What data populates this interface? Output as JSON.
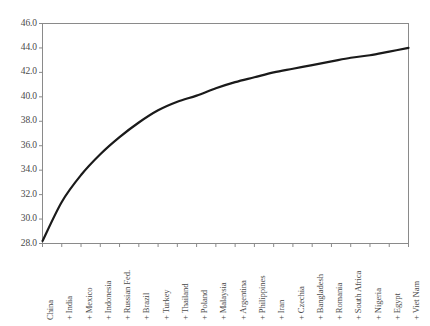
{
  "chart_data": {
    "type": "line",
    "title": "",
    "subtitle": "",
    "xlabel": "",
    "ylabel": "",
    "categories": [
      "China",
      "+ India",
      "+ Mexico",
      "+ Indonesia",
      "+ Russian Fed.",
      "+ Brazil",
      "+ Turkey",
      "+ Thailand",
      "+ Poland",
      "+ Malaysia",
      "+ Argentina",
      "+ Philippines",
      "+ Iran",
      "+ Czechia",
      "+ Bangladesh",
      "+ Romania",
      "+ South Africa",
      "+ Nigeria",
      "+ Egypt",
      "+ Viet Nam"
    ],
    "values": [
      28.2,
      31.4,
      33.6,
      35.3,
      36.7,
      37.9,
      38.9,
      39.6,
      40.1,
      40.7,
      41.2,
      41.6,
      42.0,
      42.3,
      42.6,
      42.9,
      43.2,
      43.4,
      43.7,
      44.0
    ],
    "yticks": [
      "28.0",
      "30.0",
      "32.0",
      "34.0",
      "36.0",
      "38.0",
      "40.0",
      "42.0",
      "44.0",
      "46.0"
    ],
    "ytick_values": [
      28.0,
      30.0,
      32.0,
      34.0,
      36.0,
      38.0,
      40.0,
      42.0,
      44.0,
      46.0
    ],
    "ylim": [
      28.0,
      46.0
    ],
    "xlim": [
      0,
      19
    ],
    "grid": false,
    "legend": null,
    "line_color": "#1a1a1a",
    "axis_color": "#8a8a8a",
    "text_color": "#4a4a4a",
    "background_color": "#ffffff",
    "line_width": 2.2
  }
}
